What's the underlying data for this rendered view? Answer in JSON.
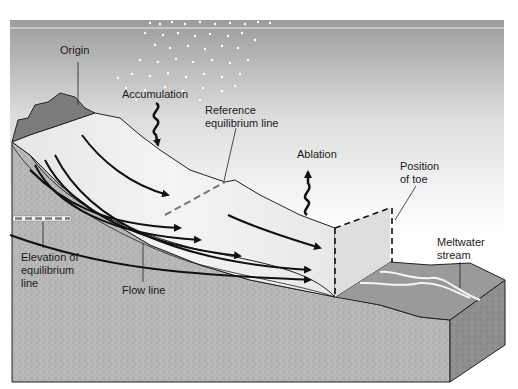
{
  "labels": {
    "origin": "Origin",
    "accumulation": "Accumulation",
    "reference_equilibrium_line": "Reference\nequilibrium line",
    "ablation": "Ablation",
    "position_of_toe": "Position\nof toe",
    "elevation_of_equilibrium_line": "Elevation of\nequilibrium\nline",
    "flow_line": "Flow line",
    "meltwater_stream": "Meltwater\nstream"
  },
  "colors": {
    "sky_top": "#9e9e9e",
    "sky_bottom": "#ffffff",
    "ice": "#eeeeee",
    "ice_shadow": "#d6d6d6",
    "bedrock": "#b5b5b5",
    "bedrock_dark": "#8a8a8a",
    "peak": "#7a7a7a",
    "outline": "#222222"
  }
}
